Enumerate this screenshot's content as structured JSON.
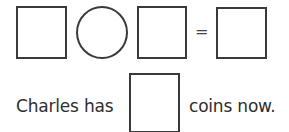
{
  "equation": {
    "operand1": "",
    "operator": "",
    "operand2": "",
    "equals_sign": "=",
    "result": ""
  },
  "sentence": {
    "prefix": "Charles has",
    "answer": "",
    "suffix": "coins now."
  }
}
